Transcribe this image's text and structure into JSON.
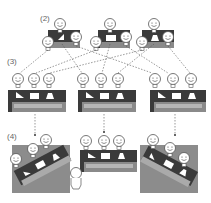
{
  "labels": {
    "step2": "(2)",
    "step3": "(3)",
    "step4": "(4)"
  },
  "colors": {
    "table_dark": "#3a3a3a",
    "table_mid": "#7a7a7a",
    "table_light": "#b5b5b5",
    "board": "#8c8c8c",
    "face_stroke": "#555555",
    "dashed_line": "#555555"
  },
  "icons": {
    "person": "smiley-face-icon",
    "triangle": "right-triangle-icon",
    "rectangle": "rectangle-icon",
    "trapezoid": "trapezoid-icon"
  },
  "sections": [
    {
      "id": "step2",
      "description": "Three expert groups each with a shared piece"
    },
    {
      "id": "step3",
      "description": "Members redistribute to three mixed groups with all three pieces"
    },
    {
      "id": "step4",
      "description": "Groups present to a facilitator"
    }
  ]
}
